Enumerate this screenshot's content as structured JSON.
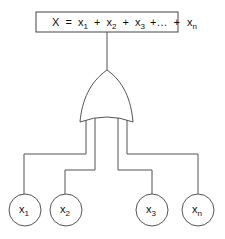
{
  "diagram": {
    "type": "or-gate-fault-tree",
    "equation": {
      "lhs": "X",
      "eq": "=",
      "terms": [
        {
          "base": "x",
          "sub": "1"
        },
        {
          "base": "x",
          "sub": "2"
        },
        {
          "base": "x",
          "sub": "3"
        },
        {
          "base": "x",
          "sub": "n"
        }
      ],
      "plus": "+",
      "ellipsis": "+…"
    },
    "gate": {
      "kind": "OR"
    },
    "inputs": [
      {
        "base": "x",
        "sub": "1"
      },
      {
        "base": "x",
        "sub": "2"
      },
      {
        "base": "x",
        "sub": "3"
      },
      {
        "base": "x",
        "sub": "n"
      }
    ],
    "colors": {
      "stroke": "#555555",
      "text": "#111111",
      "background": "#ffffff"
    }
  }
}
